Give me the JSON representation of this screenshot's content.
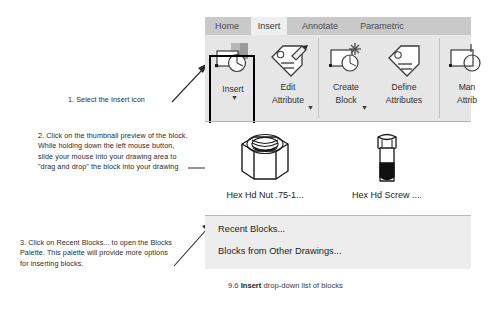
{
  "annotations": {
    "step1": "1. Select the Insert icon",
    "step2": "2. Click on the thumbnail preview of the block. While holding down the left mouse button, slide your mouse into your drawing area to \"drag and drop\" the block into your drawing",
    "step3": "3. Click on Recent Blocks... to open the Blocks Palette. This palette will provide more options for inserting blocks."
  },
  "ribbon": {
    "tabs": [
      {
        "label": "Home",
        "active": false
      },
      {
        "label": "Insert",
        "active": true
      },
      {
        "label": "Annotate",
        "active": false
      },
      {
        "label": "Parametric",
        "active": false
      }
    ],
    "buttons": [
      {
        "icon": "insert-block-icon",
        "line1": "Insert",
        "line2": "",
        "has_caret": true,
        "selected": true
      },
      {
        "icon": "edit-attribute-icon",
        "line1": "Edit",
        "line2": "Attribute",
        "has_caret": true,
        "selected": false
      },
      {
        "icon": "create-block-icon",
        "line1": "Create",
        "line2": "Block",
        "has_caret": true,
        "selected": false
      },
      {
        "icon": "define-attributes-icon",
        "line1": "Define",
        "line2": "Attributes",
        "has_caret": false,
        "selected": false
      },
      {
        "icon": "manage-attributes-icon",
        "line1": "Man",
        "line2": "Attrib",
        "has_caret": false,
        "selected": false
      }
    ]
  },
  "gallery": {
    "blocks": [
      {
        "thumb": "hex-head-nut-thumbnail",
        "label": "Hex Hd Nut .75-1..."
      },
      {
        "thumb": "hex-head-screw-thumbnail",
        "label": "Hex Hd Screw ...."
      }
    ]
  },
  "menu": {
    "items": [
      {
        "label": "Recent Blocks..."
      },
      {
        "label": "Blocks from Other Drawings..."
      }
    ]
  },
  "caption": {
    "number": "9.6 ",
    "bold": "Insert",
    "rest": " drop-down list of blocks"
  },
  "colors": {
    "tabstrip_bg": "#c9c9c9",
    "active_tab_bg": "#efefef",
    "ribbon_bg": "#e6e6e6",
    "menu_bg": "#ededed",
    "selection_outline": "#000000",
    "gallery_bg": "#ffffff",
    "ribbon_baseline": "#9fb6c4"
  }
}
